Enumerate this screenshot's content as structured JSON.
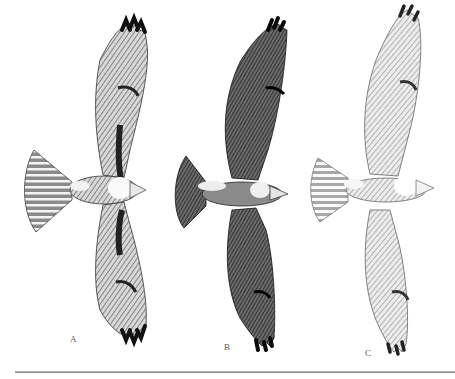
{
  "figure": {
    "style": "pen-and-ink hatched illustration, grayscale",
    "panels": [
      {
        "label": "A",
        "description": "light-morph hawk, pale breast, dark patagial marks, banded tail",
        "tone": "medium"
      },
      {
        "label": "B",
        "description": "dark-morph hawk, heavily shaded wings and tail",
        "tone": "dark"
      },
      {
        "label": "C",
        "description": "light hawk, finely hatched, pale chest",
        "tone": "light"
      }
    ]
  },
  "colors": {
    "background": "#ffffff",
    "ink_dark": "#1a1a1a",
    "ink_mid": "#6e6e6e",
    "ink_light": "#b5b5b5",
    "rule": "#9a9a9a"
  }
}
